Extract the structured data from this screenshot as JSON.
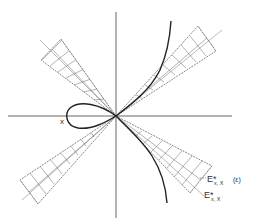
{
  "figure": {
    "type": "geometric diagram",
    "labels": {
      "point_x": "x",
      "cone_label": "E*",
      "cone_label_sub": "x, X",
      "cone_label_suffix": "(ε)",
      "line_label": "E*",
      "line_label_sub": "x, X"
    },
    "colors": {
      "axis": "#555555",
      "curve": "#222222",
      "hatch": "#666666"
    }
  }
}
